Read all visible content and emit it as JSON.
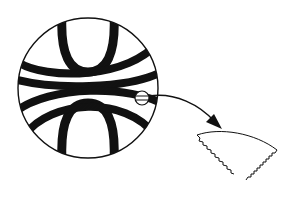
{
  "diagram": {
    "colors": {
      "stroke": "#111111",
      "background": "#ffffff"
    },
    "main_circle": {
      "cx": 88,
      "cy": 88,
      "r": 70
    },
    "detail_circle": {
      "cx": 142,
      "cy": 98,
      "r": 7
    },
    "arrow": {
      "from": [
        142,
        98
      ],
      "to": [
        222,
        128
      ]
    },
    "detail_wedge": {
      "label": "corrugated-segment"
    }
  }
}
